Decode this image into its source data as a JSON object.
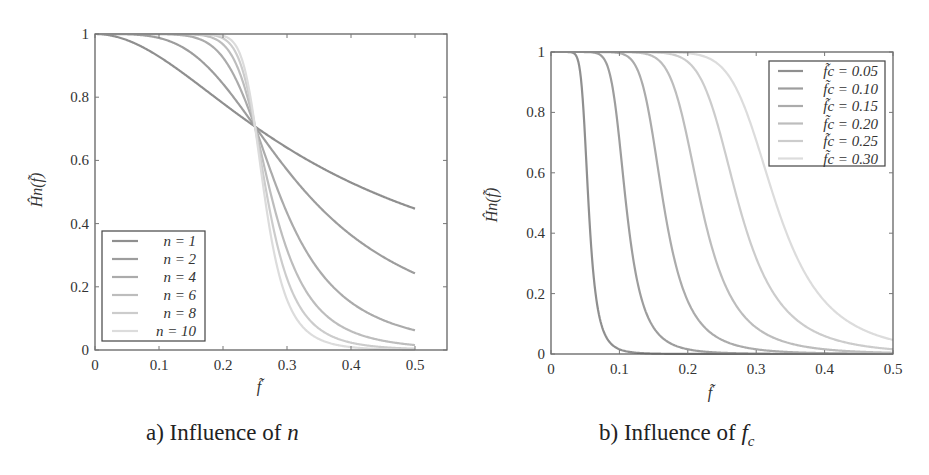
{
  "chart_data": [
    {
      "type": "line",
      "title": "",
      "caption": "a) Influence of n",
      "xlabel": "f̃",
      "ylabel": "Ĥn(f̃)",
      "xlim": [
        0,
        0.55
      ],
      "ylim": [
        0,
        1
      ],
      "xticks": [
        0,
        0.1,
        0.2,
        0.3,
        0.4,
        0.5
      ],
      "xtick_labels": [
        "0",
        "0.1",
        "0.2",
        "0.3",
        "0.4",
        "0.5"
      ],
      "yticks": [
        0,
        0.2,
        0.4,
        0.6,
        0.8,
        1
      ],
      "ytick_labels": [
        "0",
        "0.2",
        "0.4",
        "0.6",
        "0.8",
        "1"
      ],
      "grid": false,
      "legend_position": "lower left",
      "model": "H = 1/sqrt(1+(f/fc)^(2n)), fc = 0.25, f in [0,0.5]",
      "fc": 0.25,
      "series": [
        {
          "name": "n = 1",
          "n": 1,
          "color": "#8f8f8f",
          "values_at_x": {
            "0": 1,
            "0.1": 0.93,
            "0.2": 0.78,
            "0.25": 0.707,
            "0.3": 0.64,
            "0.4": 0.53,
            "0.5": 0.447
          }
        },
        {
          "name": "n = 2",
          "n": 2,
          "color": "#9d9d9d",
          "values_at_x": {
            "0": 1,
            "0.1": 0.99,
            "0.2": 0.84,
            "0.25": 0.707,
            "0.3": 0.57,
            "0.4": 0.36,
            "0.5": 0.24
          }
        },
        {
          "name": "n = 4",
          "n": 4,
          "color": "#ababab",
          "values_at_x": {
            "0": 1,
            "0.1": 1.0,
            "0.2": 0.97,
            "0.25": 0.707,
            "0.3": 0.37,
            "0.4": 0.12,
            "0.5": 0.06
          }
        },
        {
          "name": "n = 6",
          "n": 6,
          "color": "#bdbdbd",
          "values_at_x": {
            "0": 1,
            "0.1": 1.0,
            "0.2": 0.99,
            "0.25": 0.707,
            "0.3": 0.22,
            "0.4": 0.04,
            "0.5": 0.016
          }
        },
        {
          "name": "n = 8",
          "n": 8,
          "color": "#cccccc",
          "values_at_x": {
            "0": 1,
            "0.1": 1.0,
            "0.2": 1.0,
            "0.25": 0.707,
            "0.3": 0.13,
            "0.4": 0.01,
            "0.5": 0.004
          }
        },
        {
          "name": "n = 10",
          "n": 10,
          "color": "#dcdcdc",
          "values_at_x": {
            "0": 1,
            "0.1": 1.0,
            "0.2": 1.0,
            "0.25": 0.707,
            "0.3": 0.07,
            "0.4": 0.005,
            "0.5": 0.001
          }
        }
      ]
    },
    {
      "type": "line",
      "title": "",
      "caption": "b) Influence of fc",
      "xlabel": "f̃",
      "ylabel": "Ĥn(f̃)",
      "xlim": [
        0,
        0.5
      ],
      "ylim": [
        0,
        1
      ],
      "xticks": [
        0,
        0.1,
        0.2,
        0.3,
        0.4,
        0.5
      ],
      "xtick_labels": [
        "0",
        "0.1",
        "0.2",
        "0.3",
        "0.4",
        "0.5"
      ],
      "yticks": [
        0,
        0.2,
        0.4,
        0.6,
        0.8,
        1
      ],
      "ytick_labels": [
        "0",
        "0.2",
        "0.4",
        "0.6",
        "0.8",
        "1"
      ],
      "grid": false,
      "legend_position": "upper right",
      "model": "H = 1/sqrt(1+(f/fc)^(2n)), n = 6, f in [0,0.5]",
      "n": 6,
      "series": [
        {
          "name": "f̃c = 0.05",
          "fc": 0.05,
          "color": "#8f8f8f"
        },
        {
          "name": "f̃c = 0.10",
          "fc": 0.1,
          "color": "#9d9d9d"
        },
        {
          "name": "f̃c = 0.15",
          "fc": 0.15,
          "color": "#ababab"
        },
        {
          "name": "f̃c = 0.20",
          "fc": 0.2,
          "color": "#bdbdbd"
        },
        {
          "name": "f̃c = 0.25",
          "fc": 0.25,
          "color": "#cccccc"
        },
        {
          "name": "f̃c = 0.30",
          "fc": 0.3,
          "color": "#dcdcdc"
        }
      ]
    }
  ],
  "captions": {
    "a_prefix": "a) Influence of ",
    "a_var": "n",
    "b_prefix": "b) Influence of ",
    "b_var": "f",
    "b_sub": "c"
  },
  "legend_labels": {
    "a": [
      "n = 1",
      "n = 2",
      "n = 4",
      "n = 6",
      "n = 8",
      "n = 10"
    ],
    "b": [
      "f̃c = 0.05",
      "f̃c = 0.10",
      "f̃c = 0.15",
      "f̃c = 0.20",
      "f̃c = 0.25",
      "f̃c = 0.30"
    ]
  }
}
